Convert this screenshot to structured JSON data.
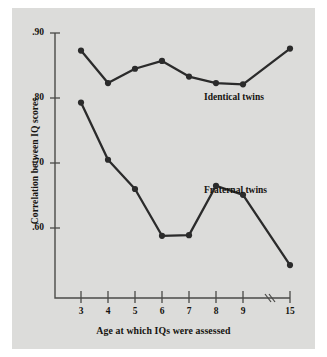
{
  "figure": {
    "background_color": "#dcdcda",
    "ink_color": "#2b2b2b"
  },
  "chart_data": {
    "type": "line",
    "title": "",
    "xlabel": "Age at which IQs were assessed",
    "ylabel": "Correlation between IQ scores",
    "x": [
      3,
      4,
      5,
      6,
      7,
      8,
      9,
      15
    ],
    "categories": [
      "3",
      "4",
      "5",
      "6",
      "7",
      "8",
      "9",
      "15"
    ],
    "xtick_labels": [
      "3",
      "4",
      "5",
      "6",
      "7",
      "8",
      "9",
      "15"
    ],
    "ytick_labels": [
      ".90",
      ".80",
      ".70",
      ".60"
    ],
    "ytick_values": [
      0.9,
      0.8,
      0.7,
      0.6
    ],
    "ylim": [
      0.52,
      0.915
    ],
    "xlim": [
      2.55,
      15.6
    ],
    "grid": false,
    "axis_break": true,
    "axis_break_note": "x-axis break between 9 and 15",
    "legend_position": "inline-right",
    "series": [
      {
        "name": "Identical twins",
        "label": "Identical twins",
        "values": [
          0.873,
          0.823,
          0.845,
          0.857,
          0.833,
          0.823,
          0.821,
          0.876
        ],
        "marker": "circle",
        "color": "#2b2b2b"
      },
      {
        "name": "Fraternal twins",
        "label": "Fraternal twins",
        "values": [
          0.793,
          0.705,
          0.66,
          0.588,
          0.589,
          0.665,
          0.651,
          0.543
        ],
        "marker": "circle",
        "color": "#2b2b2b"
      }
    ],
    "annotations": [
      {
        "text": "Identical twins",
        "x": 10.4,
        "y": 0.805
      },
      {
        "text": "Fraternal twins",
        "x": 10.4,
        "y": 0.663
      }
    ]
  }
}
